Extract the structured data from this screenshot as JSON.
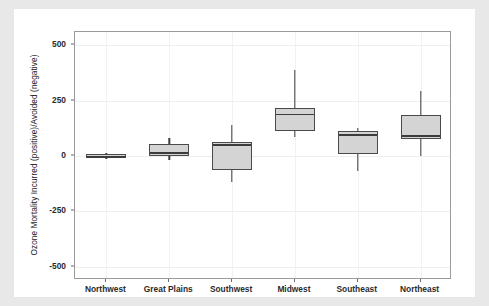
{
  "chart_data": {
    "type": "box",
    "title": "",
    "xlabel": "",
    "ylabel": "Ozone Mortality Incurred (positive)/Avoided (negative)",
    "ylim": [
      -560,
      560
    ],
    "yticks": [
      500,
      250,
      0,
      -250,
      -500
    ],
    "ytick_labels": [
      "500",
      "250",
      "0",
      "-250",
      "-500"
    ],
    "grid": true,
    "legend": "none",
    "categories": [
      "Northwest",
      "Great Plains",
      "Southwest",
      "Midwest",
      "Southeast",
      "Northeast"
    ],
    "boxes": [
      {
        "category": "Northwest",
        "whisker_low": -12,
        "q1": -8,
        "median": 0,
        "q3": 8,
        "whisker_high": 12
      },
      {
        "category": "Great Plains",
        "whisker_low": -18,
        "q1": 0,
        "median": 18,
        "q3": 55,
        "whisker_high": 80
      },
      {
        "category": "Southwest",
        "whisker_low": -118,
        "q1": -65,
        "median": 55,
        "q3": 65,
        "whisker_high": 140
      },
      {
        "category": "Midwest",
        "whisker_low": 85,
        "q1": 115,
        "median": 192,
        "q3": 215,
        "whisker_high": 390
      },
      {
        "category": "Southeast",
        "whisker_low": -68,
        "q1": 8,
        "median": 100,
        "q3": 112,
        "whisker_high": 125
      },
      {
        "category": "Northeast",
        "whisker_low": 2,
        "q1": 75,
        "median": 95,
        "q3": 185,
        "whisker_high": 295
      }
    ]
  },
  "style": {
    "box_fill": "#d4d4d4",
    "box_stroke": "#4a4a4a",
    "median_color": "#3c3c3c",
    "panel_background": "#ffffff",
    "panel_border": "#9a9a9a",
    "grid_color": "#efefef",
    "figure_background": "#ffffff",
    "page_background": "#e8e8e8",
    "text_color": "#2b2b2b"
  }
}
